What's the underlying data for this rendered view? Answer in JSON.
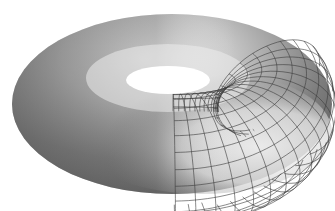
{
  "figure": {
    "background": "#ffffff",
    "shade_dark": "#6a6a6a",
    "shade_light": "#f4f4f4",
    "wire_color": "#3a3a3a",
    "center": [
      172,
      104
    ],
    "outer_radii": [
      160,
      90
    ],
    "hole_radii": [
      42,
      14
    ],
    "hole_center": [
      168,
      80
    ]
  }
}
